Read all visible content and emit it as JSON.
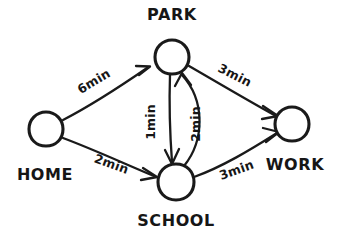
{
  "diagram": {
    "background_color": "#ffffff",
    "ink_color": "#1a1a1a",
    "nodes": [
      {
        "id": "home",
        "label": "HOME",
        "cx": 46,
        "cy": 129,
        "r": 17
      },
      {
        "id": "park",
        "label": "PARK",
        "cx": 172,
        "cy": 57,
        "r": 17
      },
      {
        "id": "school",
        "label": "SCHOOL",
        "cx": 176,
        "cy": 182,
        "r": 18
      },
      {
        "id": "work",
        "label": "WORK",
        "cx": 292,
        "cy": 124,
        "r": 17
      }
    ],
    "edges": [
      {
        "id": "home-park",
        "from": "HOME",
        "to": "PARK",
        "weight": "6",
        "unit": "min",
        "label": "6min",
        "shape": "straight"
      },
      {
        "id": "park-work",
        "from": "PARK",
        "to": "WORK",
        "weight": "3",
        "unit": "min",
        "label": "3min",
        "shape": "straight"
      },
      {
        "id": "home-school",
        "from": "HOME",
        "to": "SCHOOL",
        "weight": "2",
        "unit": "min",
        "label": "2min",
        "shape": "straight"
      },
      {
        "id": "school-work",
        "from": "SCHOOL",
        "to": "WORK",
        "weight": "3",
        "unit": "min",
        "label": "3min",
        "shape": "straight"
      },
      {
        "id": "park-school",
        "from": "PARK",
        "to": "SCHOOL",
        "weight": "1",
        "unit": "min",
        "label": "1min",
        "shape": "straight"
      },
      {
        "id": "school-park",
        "from": "SCHOOL",
        "to": "PARK",
        "weight": "2",
        "unit": "min",
        "label": "2min",
        "shape": "curved"
      }
    ]
  }
}
